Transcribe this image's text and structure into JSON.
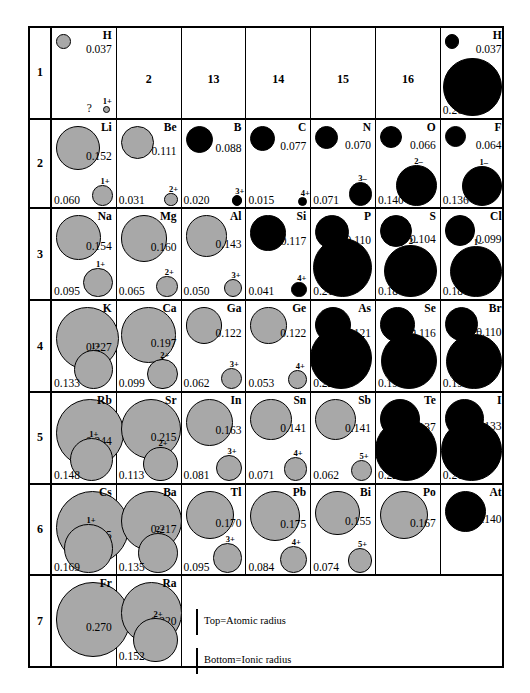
{
  "legend": {
    "top_label": "Top=Atomic radius",
    "bottom_label": "Bottom=Ionic radius"
  },
  "groups": [
    "2",
    "13",
    "14",
    "15",
    "16"
  ],
  "rows": [
    {
      "number": "1",
      "elements": [
        {
          "symbol": "H",
          "atomic": "0.037",
          "atomic_color": "gray",
          "ion_charge": "1+",
          "ionic": "?",
          "ion_color": "gray",
          "group": 1
        },
        {
          "symbol": "H",
          "atomic": "0.037",
          "atomic_color": "black",
          "ion_charge": "",
          "ionic": "0.208",
          "ion_color": "black",
          "group": 17
        }
      ]
    },
    {
      "number": "2",
      "elements": [
        {
          "symbol": "Li",
          "atomic": "0.152",
          "atomic_color": "gray",
          "ion_charge": "1+",
          "ionic": "0.060",
          "ion_color": "gray"
        },
        {
          "symbol": "Be",
          "atomic": "0.111",
          "atomic_color": "gray",
          "ion_charge": "2+",
          "ionic": "0.031",
          "ion_color": "gray"
        },
        {
          "symbol": "B",
          "atomic": "0.088",
          "atomic_color": "black",
          "ion_charge": "3+",
          "ionic": "0.020",
          "ion_color": "black"
        },
        {
          "symbol": "C",
          "atomic": "0.077",
          "atomic_color": "black",
          "ion_charge": "4+",
          "ionic": "0.015",
          "ion_color": "black"
        },
        {
          "symbol": "N",
          "atomic": "0.070",
          "atomic_color": "black",
          "ion_charge": "3–",
          "ionic": "0.071",
          "ion_color": "black"
        },
        {
          "symbol": "O",
          "atomic": "0.066",
          "atomic_color": "black",
          "ion_charge": "2–",
          "ionic": "0.140",
          "ion_color": "black"
        },
        {
          "symbol": "F",
          "atomic": "0.064",
          "atomic_color": "black",
          "ion_charge": "1–",
          "ionic": "0.136",
          "ion_color": "black"
        }
      ]
    },
    {
      "number": "3",
      "elements": [
        {
          "symbol": "Na",
          "atomic": "0.154",
          "atomic_color": "gray",
          "ion_charge": "1+",
          "ionic": "0.095",
          "ion_color": "gray"
        },
        {
          "symbol": "Mg",
          "atomic": "0.160",
          "atomic_color": "gray",
          "ion_charge": "2+",
          "ionic": "0.065",
          "ion_color": "gray"
        },
        {
          "symbol": "Al",
          "atomic": "0.143",
          "atomic_color": "gray",
          "ion_charge": "3+",
          "ionic": "0.050",
          "ion_color": "gray"
        },
        {
          "symbol": "Si",
          "atomic": "0.117",
          "atomic_color": "black",
          "ion_charge": "4+",
          "ionic": "0.041",
          "ion_color": "black"
        },
        {
          "symbol": "P",
          "atomic": "0.110",
          "atomic_color": "black",
          "ion_charge": "3–",
          "ionic": "0.212",
          "ion_color": "black"
        },
        {
          "symbol": "S",
          "atomic": "0.104",
          "atomic_color": "black",
          "ion_charge": "2–",
          "ionic": "0.184",
          "ion_color": "black"
        },
        {
          "symbol": "Cl",
          "atomic": "0.099",
          "atomic_color": "black",
          "ion_charge": "1–",
          "ionic": "0.181",
          "ion_color": "black"
        }
      ]
    },
    {
      "number": "4",
      "elements": [
        {
          "symbol": "K",
          "atomic": "0.227",
          "atomic_color": "gray",
          "ion_charge": "1+",
          "ionic": "0.133",
          "ion_color": "gray"
        },
        {
          "symbol": "Ca",
          "atomic": "0.197",
          "atomic_color": "gray",
          "ion_charge": "2+",
          "ionic": "0.099",
          "ion_color": "gray"
        },
        {
          "symbol": "Ga",
          "atomic": "0.122",
          "atomic_color": "gray",
          "ion_charge": "3+",
          "ionic": "0.062",
          "ion_color": "gray"
        },
        {
          "symbol": "Ge",
          "atomic": "0.122",
          "atomic_color": "gray",
          "ion_charge": "4+",
          "ionic": "0.053",
          "ion_color": "gray"
        },
        {
          "symbol": "As",
          "atomic": "0.121",
          "atomic_color": "black",
          "ion_charge": "3–",
          "ionic": "0.222",
          "ion_color": "black"
        },
        {
          "symbol": "Se",
          "atomic": "0.116",
          "atomic_color": "black",
          "ion_charge": "2–",
          "ionic": "0.198",
          "ion_color": "black"
        },
        {
          "symbol": "Br",
          "atomic": "0.110",
          "atomic_color": "black",
          "ion_charge": "1–",
          "ionic": "0.195",
          "ion_color": "black"
        }
      ]
    },
    {
      "number": "5",
      "elements": [
        {
          "symbol": "Rb",
          "atomic": "0.244",
          "atomic_color": "gray",
          "ion_charge": "1+",
          "ionic": "0.148",
          "ion_color": "gray"
        },
        {
          "symbol": "Sr",
          "atomic": "0.215",
          "atomic_color": "gray",
          "ion_charge": "2+",
          "ionic": "0.113",
          "ion_color": "gray"
        },
        {
          "symbol": "In",
          "atomic": "0.163",
          "atomic_color": "gray",
          "ion_charge": "3+",
          "ionic": "0.081",
          "ion_color": "gray"
        },
        {
          "symbol": "Sn",
          "atomic": "0.141",
          "atomic_color": "gray",
          "ion_charge": "4+",
          "ionic": "0.071",
          "ion_color": "gray"
        },
        {
          "symbol": "Sb",
          "atomic": "0.141",
          "atomic_color": "gray",
          "ion_charge": "5+",
          "ionic": "0.062",
          "ion_color": "gray"
        },
        {
          "symbol": "Te",
          "atomic": "0.137",
          "atomic_color": "black",
          "ion_charge": "2–",
          "ionic": "0.221",
          "ion_color": "black"
        },
        {
          "symbol": "I",
          "atomic": "0.133",
          "atomic_color": "black",
          "ion_charge": "1–",
          "ionic": "0.216",
          "ion_color": "black"
        }
      ]
    },
    {
      "number": "6",
      "elements": [
        {
          "symbol": "Cs",
          "atomic": "0.265",
          "atomic_color": "gray",
          "ion_charge": "1+",
          "ionic": "0.169",
          "ion_color": "gray"
        },
        {
          "symbol": "Ba",
          "atomic": "0.217",
          "atomic_color": "gray",
          "ion_charge": "2+",
          "ionic": "0.135",
          "ion_color": "gray"
        },
        {
          "symbol": "Tl",
          "atomic": "0.170",
          "atomic_color": "gray",
          "ion_charge": "3+",
          "ionic": "0.095",
          "ion_color": "gray"
        },
        {
          "symbol": "Pb",
          "atomic": "0.175",
          "atomic_color": "gray",
          "ion_charge": "4+",
          "ionic": "0.084",
          "ion_color": "gray"
        },
        {
          "symbol": "Bi",
          "atomic": "0.155",
          "atomic_color": "gray",
          "ion_charge": "5+",
          "ionic": "0.074",
          "ion_color": "gray"
        },
        {
          "symbol": "Po",
          "atomic": "0.167",
          "atomic_color": "gray",
          "ion_charge": "",
          "ionic": "",
          "ion_color": ""
        },
        {
          "symbol": "At",
          "atomic": "0.140",
          "atomic_color": "black",
          "ion_charge": "",
          "ionic": "",
          "ion_color": ""
        }
      ]
    },
    {
      "number": "7",
      "elements": [
        {
          "symbol": "Fr",
          "atomic": "0.270",
          "atomic_color": "gray",
          "ion_charge": "",
          "ionic": "",
          "ion_color": ""
        },
        {
          "symbol": "Ra",
          "atomic": "0.220",
          "atomic_color": "gray",
          "ion_charge": "2+",
          "ionic": "0.152",
          "ion_color": "gray"
        }
      ]
    }
  ],
  "chart_data": {
    "type": "table",
    "units": "nm",
    "encoding": "circle area/diameter proportional to radius; gray = cation/metal shading, black = anion/nonmetal shading",
    "columns": [
      "1",
      "2",
      "13",
      "14",
      "15",
      "16",
      "17"
    ],
    "row_labels": [
      "1",
      "2",
      "3",
      "4",
      "5",
      "6",
      "7"
    ],
    "points": [
      {
        "symbol": "H",
        "period": 1,
        "group": 1,
        "atomic_radius": 0.037,
        "ion_charge": "1+",
        "ionic_radius": null
      },
      {
        "symbol": "H",
        "period": 1,
        "group": 17,
        "atomic_radius": 0.037,
        "ion_charge": "1-",
        "ionic_radius": 0.208
      },
      {
        "symbol": "Li",
        "period": 2,
        "group": 1,
        "atomic_radius": 0.152,
        "ion_charge": "1+",
        "ionic_radius": 0.06
      },
      {
        "symbol": "Be",
        "period": 2,
        "group": 2,
        "atomic_radius": 0.111,
        "ion_charge": "2+",
        "ionic_radius": 0.031
      },
      {
        "symbol": "B",
        "period": 2,
        "group": 13,
        "atomic_radius": 0.088,
        "ion_charge": "3+",
        "ionic_radius": 0.02
      },
      {
        "symbol": "C",
        "period": 2,
        "group": 14,
        "atomic_radius": 0.077,
        "ion_charge": "4+",
        "ionic_radius": 0.015
      },
      {
        "symbol": "N",
        "period": 2,
        "group": 15,
        "atomic_radius": 0.07,
        "ion_charge": "3-",
        "ionic_radius": 0.071
      },
      {
        "symbol": "O",
        "period": 2,
        "group": 16,
        "atomic_radius": 0.066,
        "ion_charge": "2-",
        "ionic_radius": 0.14
      },
      {
        "symbol": "F",
        "period": 2,
        "group": 17,
        "atomic_radius": 0.064,
        "ion_charge": "1-",
        "ionic_radius": 0.136
      },
      {
        "symbol": "Na",
        "period": 3,
        "group": 1,
        "atomic_radius": 0.154,
        "ion_charge": "1+",
        "ionic_radius": 0.095
      },
      {
        "symbol": "Mg",
        "period": 3,
        "group": 2,
        "atomic_radius": 0.16,
        "ion_charge": "2+",
        "ionic_radius": 0.065
      },
      {
        "symbol": "Al",
        "period": 3,
        "group": 13,
        "atomic_radius": 0.143,
        "ion_charge": "3+",
        "ionic_radius": 0.05
      },
      {
        "symbol": "Si",
        "period": 3,
        "group": 14,
        "atomic_radius": 0.117,
        "ion_charge": "4+",
        "ionic_radius": 0.041
      },
      {
        "symbol": "P",
        "period": 3,
        "group": 15,
        "atomic_radius": 0.11,
        "ion_charge": "3-",
        "ionic_radius": 0.212
      },
      {
        "symbol": "S",
        "period": 3,
        "group": 16,
        "atomic_radius": 0.104,
        "ion_charge": "2-",
        "ionic_radius": 0.184
      },
      {
        "symbol": "Cl",
        "period": 3,
        "group": 17,
        "atomic_radius": 0.099,
        "ion_charge": "1-",
        "ionic_radius": 0.181
      },
      {
        "symbol": "K",
        "period": 4,
        "group": 1,
        "atomic_radius": 0.227,
        "ion_charge": "1+",
        "ionic_radius": 0.133
      },
      {
        "symbol": "Ca",
        "period": 4,
        "group": 2,
        "atomic_radius": 0.197,
        "ion_charge": "2+",
        "ionic_radius": 0.099
      },
      {
        "symbol": "Ga",
        "period": 4,
        "group": 13,
        "atomic_radius": 0.122,
        "ion_charge": "3+",
        "ionic_radius": 0.062
      },
      {
        "symbol": "Ge",
        "period": 4,
        "group": 14,
        "atomic_radius": 0.122,
        "ion_charge": "4+",
        "ionic_radius": 0.053
      },
      {
        "symbol": "As",
        "period": 4,
        "group": 15,
        "atomic_radius": 0.121,
        "ion_charge": "3-",
        "ionic_radius": 0.222
      },
      {
        "symbol": "Se",
        "period": 4,
        "group": 16,
        "atomic_radius": 0.116,
        "ion_charge": "2-",
        "ionic_radius": 0.198
      },
      {
        "symbol": "Br",
        "period": 4,
        "group": 17,
        "atomic_radius": 0.11,
        "ion_charge": "1-",
        "ionic_radius": 0.195
      },
      {
        "symbol": "Rb",
        "period": 5,
        "group": 1,
        "atomic_radius": 0.244,
        "ion_charge": "1+",
        "ionic_radius": 0.148
      },
      {
        "symbol": "Sr",
        "period": 5,
        "group": 2,
        "atomic_radius": 0.215,
        "ion_charge": "2+",
        "ionic_radius": 0.113
      },
      {
        "symbol": "In",
        "period": 5,
        "group": 13,
        "atomic_radius": 0.163,
        "ion_charge": "3+",
        "ionic_radius": 0.081
      },
      {
        "symbol": "Sn",
        "period": 5,
        "group": 14,
        "atomic_radius": 0.141,
        "ion_charge": "4+",
        "ionic_radius": 0.071
      },
      {
        "symbol": "Sb",
        "period": 5,
        "group": 15,
        "atomic_radius": 0.141,
        "ion_charge": "5+",
        "ionic_radius": 0.062
      },
      {
        "symbol": "Te",
        "period": 5,
        "group": 16,
        "atomic_radius": 0.137,
        "ion_charge": "2-",
        "ionic_radius": 0.221
      },
      {
        "symbol": "I",
        "period": 5,
        "group": 17,
        "atomic_radius": 0.133,
        "ion_charge": "1-",
        "ionic_radius": 0.216
      },
      {
        "symbol": "Cs",
        "period": 6,
        "group": 1,
        "atomic_radius": 0.265,
        "ion_charge": "1+",
        "ionic_radius": 0.169
      },
      {
        "symbol": "Ba",
        "period": 6,
        "group": 2,
        "atomic_radius": 0.217,
        "ion_charge": "2+",
        "ionic_radius": 0.135
      },
      {
        "symbol": "Tl",
        "period": 6,
        "group": 13,
        "atomic_radius": 0.17,
        "ion_charge": "3+",
        "ionic_radius": 0.095
      },
      {
        "symbol": "Pb",
        "period": 6,
        "group": 14,
        "atomic_radius": 0.175,
        "ion_charge": "4+",
        "ionic_radius": 0.084
      },
      {
        "symbol": "Bi",
        "period": 6,
        "group": 15,
        "atomic_radius": 0.155,
        "ion_charge": "5+",
        "ionic_radius": 0.074
      },
      {
        "symbol": "Po",
        "period": 6,
        "group": 16,
        "atomic_radius": 0.167,
        "ion_charge": null,
        "ionic_radius": null
      },
      {
        "symbol": "At",
        "period": 6,
        "group": 17,
        "atomic_radius": 0.14,
        "ion_charge": null,
        "ionic_radius": null
      },
      {
        "symbol": "Fr",
        "period": 7,
        "group": 1,
        "atomic_radius": 0.27,
        "ion_charge": null,
        "ionic_radius": null
      },
      {
        "symbol": "Ra",
        "period": 7,
        "group": 2,
        "atomic_radius": 0.22,
        "ion_charge": "2+",
        "ionic_radius": 0.152
      }
    ]
  }
}
